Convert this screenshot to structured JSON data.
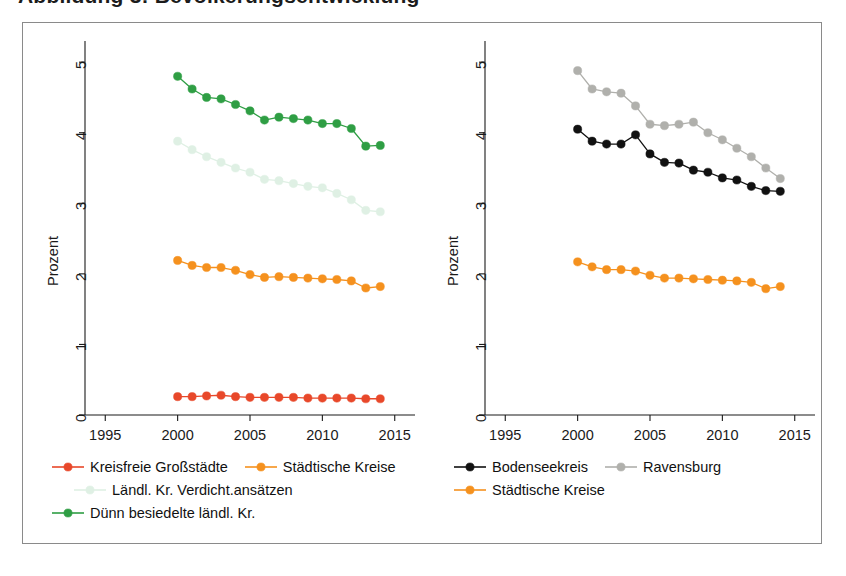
{
  "figure": {
    "title_remnant": "Abbildung 3: Bevölkerungsentwicklung"
  },
  "colors": {
    "kreisfreie_grossstaedte": "#e8482a",
    "staedtische_kreise": "#f5911e",
    "laendl_verdicht": "#dff0e4",
    "duenn_besiedelt": "#2f9e44",
    "bodenseekreis": "#111111",
    "ravensburg": "#b0b0ac",
    "axis": "#1a1a1a",
    "frame": "#8a8a8a"
  },
  "axes": {
    "ylabel": "Prozent",
    "yticks": [
      "0",
      "1",
      "2",
      "3",
      "4",
      "5"
    ],
    "ytick_values": [
      0,
      1,
      2,
      3,
      4,
      5
    ],
    "xticks": [
      "1995",
      "2000",
      "2005",
      "2010",
      "2015"
    ],
    "xtick_values": [
      1995,
      2000,
      2005,
      2010,
      2015
    ],
    "xlim": [
      1993.6,
      2016.4
    ],
    "ylim": [
      0,
      5.3
    ]
  },
  "legend_left": [
    {
      "label": "Kreisfreie Großstädte",
      "color": "#e8482a",
      "marker": true,
      "line": true
    },
    {
      "label": "Städtische Kreise",
      "color": "#f5911e",
      "marker": true,
      "line": true
    },
    {
      "label": "Ländl. Kr. Verdicht.ansätzen",
      "color": "#dff0e4",
      "marker": true,
      "line": true
    },
    {
      "label": "Dünn besiedelte ländl. Kr.",
      "color": "#2f9e44",
      "marker": true,
      "line": true
    }
  ],
  "legend_right": [
    {
      "label": "Bodenseekreis",
      "color": "#111111",
      "marker": true,
      "line": true
    },
    {
      "label": "Ravensburg",
      "color": "#b0b0ac",
      "marker": true,
      "line": true
    },
    {
      "label": "Städtische Kreise",
      "color": "#f5911e",
      "marker": true,
      "line": true
    }
  ],
  "chart_data": [
    {
      "type": "line",
      "panel": "left",
      "title": "",
      "xlabel": "",
      "ylabel": "Prozent",
      "xlim": [
        1993.6,
        2016.4
      ],
      "ylim": [
        0,
        5.3
      ],
      "grid": false,
      "legend_position": "below",
      "x": [
        2000,
        2001,
        2002,
        2003,
        2004,
        2005,
        2006,
        2007,
        2008,
        2009,
        2010,
        2011,
        2012,
        2013,
        2014
      ],
      "series": [
        {
          "name": "Dünn besiedelte ländl. Kr.",
          "color": "#2f9e44",
          "values": [
            4.8,
            4.62,
            4.5,
            4.48,
            4.4,
            4.31,
            4.18,
            4.22,
            4.2,
            4.18,
            4.13,
            4.13,
            4.06,
            3.81,
            3.82
          ]
        },
        {
          "name": "Ländl. Kr. Verdicht.ansätzen",
          "color": "#dff0e4",
          "values": [
            3.88,
            3.76,
            3.66,
            3.58,
            3.5,
            3.44,
            3.34,
            3.32,
            3.28,
            3.24,
            3.22,
            3.14,
            3.05,
            2.9,
            2.88
          ]
        },
        {
          "name": "Städtische Kreise",
          "color": "#f5911e",
          "values": [
            2.19,
            2.12,
            2.09,
            2.09,
            2.05,
            1.99,
            1.95,
            1.96,
            1.95,
            1.94,
            1.93,
            1.92,
            1.9,
            1.8,
            1.82
          ]
        },
        {
          "name": "Kreisfreie Großstädte",
          "color": "#e8482a",
          "values": [
            0.26,
            0.26,
            0.27,
            0.28,
            0.26,
            0.25,
            0.25,
            0.25,
            0.25,
            0.24,
            0.24,
            0.24,
            0.24,
            0.23,
            0.23
          ]
        }
      ]
    },
    {
      "type": "line",
      "panel": "right",
      "title": "",
      "xlabel": "",
      "ylabel": "Prozent",
      "xlim": [
        1993.6,
        2016.4
      ],
      "ylim": [
        0,
        5.3
      ],
      "grid": false,
      "legend_position": "below",
      "x": [
        2000,
        2001,
        2002,
        2003,
        2004,
        2005,
        2006,
        2007,
        2008,
        2009,
        2010,
        2011,
        2012,
        2013,
        2014
      ],
      "series": [
        {
          "name": "Ravensburg",
          "color": "#b0b0ac",
          "values": [
            4.88,
            4.62,
            4.58,
            4.56,
            4.38,
            4.12,
            4.1,
            4.12,
            4.15,
            4.0,
            3.9,
            3.78,
            3.66,
            3.5,
            3.35
          ]
        },
        {
          "name": "Bodenseekreis",
          "color": "#111111",
          "values": [
            4.05,
            3.88,
            3.84,
            3.84,
            3.97,
            3.7,
            3.58,
            3.57,
            3.47,
            3.44,
            3.36,
            3.33,
            3.24,
            3.18,
            3.17
          ]
        },
        {
          "name": "Städtische Kreise",
          "color": "#f5911e",
          "values": [
            2.17,
            2.1,
            2.06,
            2.06,
            2.04,
            1.98,
            1.94,
            1.94,
            1.93,
            1.92,
            1.91,
            1.9,
            1.88,
            1.79,
            1.82
          ]
        }
      ]
    }
  ]
}
